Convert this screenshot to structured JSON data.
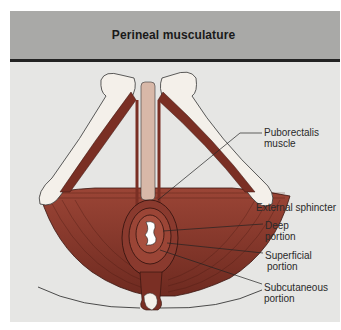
{
  "figure": {
    "title": "Perineal musculature",
    "colors": {
      "header_bg": "#a9a9a7",
      "body_bg": "#e6e6e4",
      "rule": "#232323",
      "muscle": "#8a3a2e",
      "muscle_dark": "#5e2219",
      "bone": "#f4f0ea"
    },
    "labels": {
      "puborectalis": [
        "Puborectalis",
        "muscle"
      ],
      "external_sphincter": "External sphincter",
      "deep": [
        "Deep",
        "portion"
      ],
      "superficial": [
        "Superficial",
        "portion"
      ],
      "subcutaneous": [
        "Subcutaneous",
        "portion"
      ]
    }
  }
}
